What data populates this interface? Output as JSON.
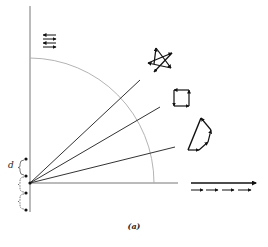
{
  "figure": {
    "caption": "(a)",
    "spacing_label": "d",
    "colors": {
      "axis": "#777777",
      "arc": "#aaaaaa",
      "ray": "#333333",
      "ink": "#111111",
      "background": "#ffffff"
    },
    "origin": [
      30,
      183
    ],
    "axes": {
      "vertical": {
        "x": 30,
        "y_top": 6,
        "y_bottom": 212
      },
      "horizontal": {
        "y": 183,
        "x_left": 30,
        "x_right": 178
      }
    },
    "arc": {
      "radius": 124,
      "description": "quarter circle about origin"
    },
    "rays": [
      {
        "end": [
          140,
          80
        ]
      },
      {
        "end": [
          160,
          107
        ]
      },
      {
        "end": [
          175,
          147
        ]
      }
    ],
    "sources": {
      "dots": [
        [
          26,
          159
        ],
        [
          26,
          176
        ],
        [
          26,
          193
        ],
        [
          26,
          210
        ]
      ],
      "bracket_marks": 3
    },
    "phasor_diagrams": [
      {
        "name": "alternating-arrows",
        "description": "four stacked arrows alternating left/right (zero net resultant)"
      },
      {
        "name": "star-polygon",
        "description": "closed star-shaped arrow chain"
      },
      {
        "name": "square-loop",
        "description": "closed square arrow chain"
      },
      {
        "name": "open-polygon",
        "description": "partially curled arrow chain with resultant"
      },
      {
        "name": "aligned-arrows",
        "description": "four collinear arrows summing to one long resultant"
      }
    ]
  }
}
